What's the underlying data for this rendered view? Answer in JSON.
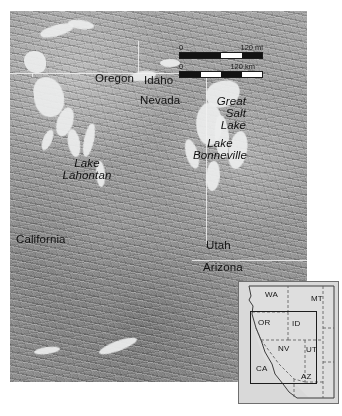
{
  "figure": {
    "kind": "shaded-relief-map",
    "background_color": "#ffffff",
    "terrain_color": "#9a9a9a",
    "lake_color": "#eceded",
    "border_color": "#f0f0f0",
    "label_color": "#111111"
  },
  "main_map": {
    "state_labels": [
      {
        "name": "Oregon",
        "text": "Oregon",
        "x": 95,
        "y": 72
      },
      {
        "name": "Idaho",
        "text": "Idaho",
        "x": 144,
        "y": 74
      },
      {
        "name": "Nevada",
        "text": "Nevada",
        "x": 140,
        "y": 94
      },
      {
        "name": "California",
        "text": "California",
        "x": 16,
        "y": 233
      },
      {
        "name": "Utah",
        "text": "Utah",
        "x": 206,
        "y": 239
      },
      {
        "name": "Arizona",
        "text": "Arizona",
        "x": 203,
        "y": 261
      }
    ],
    "lake_labels": [
      {
        "name": "great-salt-lake",
        "lines": [
          "Great",
          "Salt",
          "Lake"
        ],
        "x": 226,
        "y": 98,
        "align": "right",
        "style": "italic"
      },
      {
        "name": "lake-bonneville",
        "lines": [
          "Lake",
          "Bonneville"
        ],
        "x": 200,
        "y": 135,
        "align": "center",
        "style": "italic"
      },
      {
        "name": "lake-lahontan",
        "lines": [
          "Lake",
          "Lahontan"
        ],
        "x": 72,
        "y": 155,
        "align": "center",
        "style": "italic"
      }
    ]
  },
  "scale_bar": {
    "name": "scale-bar",
    "miles": {
      "zero": "0",
      "max": "120 mi",
      "value": 120,
      "unit": "mi",
      "segments": 4
    },
    "kilometers": {
      "zero": "0",
      "max": "120 km",
      "value": 120,
      "unit": "km",
      "segments": 4
    }
  },
  "inset_map": {
    "name": "locator-inset",
    "extent_box_label": "main map extent",
    "states": [
      {
        "code": "WA",
        "x": 26,
        "y": 10
      },
      {
        "code": "MT",
        "x": 73,
        "y": 14
      },
      {
        "code": "OR",
        "x": 20,
        "y": 39
      },
      {
        "code": "ID",
        "x": 54,
        "y": 40
      },
      {
        "code": "NV",
        "x": 40,
        "y": 66
      },
      {
        "code": "UT",
        "x": 66,
        "y": 67
      },
      {
        "code": "CA",
        "x": 18,
        "y": 85
      },
      {
        "code": "AZ",
        "x": 63,
        "y": 93
      }
    ]
  }
}
